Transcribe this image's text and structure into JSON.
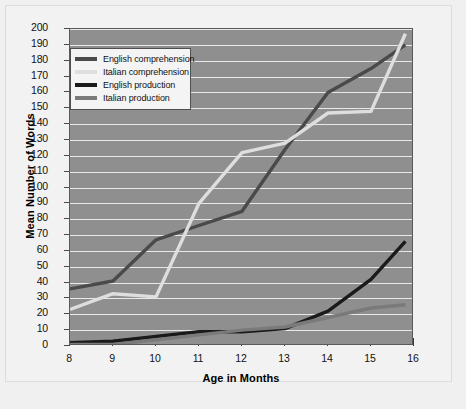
{
  "chart_data": {
    "type": "line",
    "title": "",
    "xlabel": "Age in Months",
    "ylabel": "Mean Number of Words",
    "xlim": [
      8,
      16
    ],
    "ylim": [
      0,
      200
    ],
    "grid": true,
    "legend_position": "top-left",
    "x": [
      8,
      9,
      10,
      11,
      12,
      13,
      14,
      15,
      15.8
    ],
    "xticks": [
      "8",
      "9",
      "10",
      "11",
      "12",
      "13",
      "14",
      "15",
      "16"
    ],
    "yticks": [
      "0",
      "10",
      "20",
      "30",
      "40",
      "50",
      "60",
      "70",
      "80",
      "90",
      "100",
      "110",
      "120",
      "130",
      "140",
      "150",
      "160",
      "170",
      "180",
      "190",
      "200"
    ],
    "series": [
      {
        "name": "English comprehension",
        "color": "#4a4a4a",
        "values": [
          36,
          41,
          67,
          76,
          85,
          124,
          160,
          175,
          190
        ]
      },
      {
        "name": "Italian comprehension",
        "color": "#dedede",
        "values": [
          23,
          33,
          31,
          90,
          122,
          128,
          147,
          148,
          197
        ]
      },
      {
        "name": "English production",
        "color": "#1a1a1a",
        "values": [
          2,
          3,
          6,
          9,
          9,
          11,
          22,
          42,
          66
        ]
      },
      {
        "name": "Italian production",
        "color": "#7a7a7a",
        "values": [
          1,
          1,
          4,
          7,
          10,
          12,
          18,
          24,
          26
        ]
      }
    ]
  },
  "legend": {
    "items": [
      {
        "label": "English comprehension"
      },
      {
        "label": "Italian comprehension"
      },
      {
        "label": "English production"
      },
      {
        "label": "Italian production"
      }
    ]
  },
  "axes": {
    "x_title": "Age in Months",
    "y_title": "Mean Number of Words"
  }
}
